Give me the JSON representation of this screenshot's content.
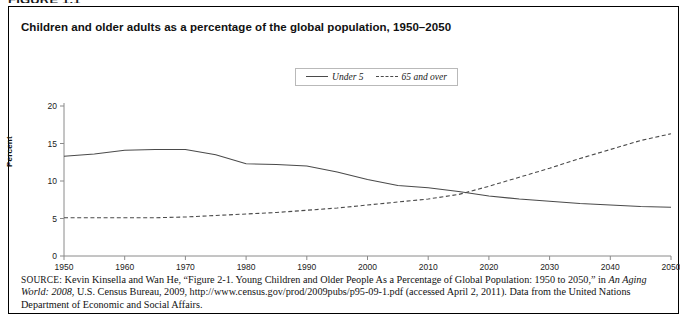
{
  "figure": {
    "number_label": "FIGURE 1.1",
    "title": "Children and older adults as a percentage of the global population, 1950–2050"
  },
  "legend": {
    "position": "top-center",
    "entries": [
      {
        "label": "Under 5",
        "style": "solid",
        "color": "#4a4a4a"
      },
      {
        "label": "65 and over",
        "style": "dashed",
        "color": "#4a4a4a"
      }
    ]
  },
  "axes": {
    "y_label": "Percent",
    "y_ticks": [
      "0",
      "5",
      "10",
      "15",
      "20"
    ],
    "x_ticks": [
      "1950",
      "1960",
      "1970",
      "1980",
      "1990",
      "2000",
      "2010",
      "2020",
      "2030",
      "2040",
      "2050"
    ]
  },
  "source": {
    "kicker": "SOURCE:",
    "text_part1": " Kevin Kinsella and Wan He, “Figure 2-1. Young Children and Older People As a Percentage of Global Population: 1950 to 2050,” in ",
    "italic1": "An Aging World: 2008",
    "text_part2": ", U.S. Census Bureau, 2009, http://www.census.gov/prod/2009pubs/p95-09-1.pdf (accessed April 2, 2011). Data from the United Nations Department of Economic and Social Affairs."
  },
  "chart_data": {
    "type": "line",
    "title": "Children and older adults as a percentage of the global population, 1950–2050",
    "xlabel": "",
    "ylabel": "Percent",
    "xlim": [
      1950,
      2050
    ],
    "ylim": [
      0,
      20
    ],
    "grid": false,
    "legend_position": "top-center",
    "x": [
      1950,
      1955,
      1960,
      1965,
      1970,
      1975,
      1980,
      1985,
      1990,
      1995,
      2000,
      2005,
      2010,
      2015,
      2020,
      2025,
      2030,
      2035,
      2040,
      2045,
      2050
    ],
    "series": [
      {
        "name": "Under 5",
        "style": "solid",
        "color": "#4a4a4a",
        "values": [
          13.3,
          13.6,
          14.1,
          14.2,
          14.2,
          13.5,
          12.3,
          12.2,
          12.0,
          11.2,
          10.2,
          9.4,
          9.1,
          8.6,
          8.0,
          7.6,
          7.3,
          7.0,
          6.8,
          6.6,
          6.5
        ]
      },
      {
        "name": "65 and over",
        "style": "dashed",
        "color": "#4a4a4a",
        "values": [
          5.1,
          5.1,
          5.1,
          5.1,
          5.2,
          5.4,
          5.6,
          5.8,
          6.1,
          6.4,
          6.8,
          7.2,
          7.6,
          8.2,
          9.3,
          10.5,
          11.7,
          13.0,
          14.2,
          15.4,
          16.3
        ]
      }
    ],
    "annotations": [
      {
        "text": "crossover of Under 5 and 65 and over",
        "x": 2017,
        "y": 8.4
      }
    ]
  }
}
